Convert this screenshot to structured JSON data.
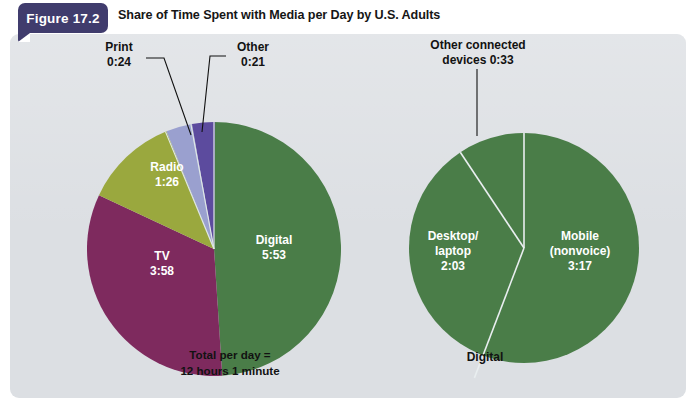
{
  "figure": {
    "badge_label": "Figure 17.2",
    "title": "Share of Time Spent with Media per Day by U.S. Adults"
  },
  "colors": {
    "badge_bg": "#403c6d",
    "panel_bg": "#dcdfe3",
    "digital_green": "#4a7d48",
    "tv_magenta": "#7e2a5e",
    "radio_olive": "#9aa83e",
    "print_periwinkle": "#9aa0cf",
    "other_purple": "#5c4b9e",
    "label_dark": "#121212",
    "label_light": "#ffffff"
  },
  "chart_data": [
    {
      "type": "pie",
      "name": "media-share-pie",
      "title": "Share of Time Spent with Media per Day by U.S. Adults",
      "total_label_line1": "Total per day =",
      "total_label_line2": "12 hours 1 minute",
      "total_minutes": 721,
      "legend": "inside-and-callout",
      "categories": [
        "Digital",
        "Other",
        "Print",
        "Radio",
        "TV"
      ],
      "values": [
        353,
        21,
        24,
        86,
        238
      ],
      "slices": [
        {
          "label": "Digital",
          "value_label": "5:53",
          "minutes": 353,
          "color": "#4a7d48",
          "label_position": "inside"
        },
        {
          "label": "Other",
          "value_label": "0:21",
          "minutes": 21,
          "color": "#5c4b9e",
          "label_position": "callout"
        },
        {
          "label": "Print",
          "value_label": "0:24",
          "minutes": 24,
          "color": "#9aa0cf",
          "label_position": "callout"
        },
        {
          "label": "Radio",
          "value_label": "1:26",
          "minutes": 86,
          "color": "#9aa83e",
          "label_position": "inside"
        },
        {
          "label": "TV",
          "value_label": "3:58",
          "minutes": 238,
          "color": "#7e2a5e",
          "label_position": "inside"
        }
      ]
    },
    {
      "type": "pie",
      "name": "digital-breakout-pie",
      "title": "Digital",
      "breakout_label": "Digital",
      "total_minutes": 353,
      "legend": "inside-and-callout",
      "categories": [
        "Mobile (nonvoice)",
        "Desktop/laptop",
        "Other connected devices"
      ],
      "values": [
        197,
        123,
        33
      ],
      "slices": [
        {
          "label": "Mobile",
          "label_line2": "(nonvoice)",
          "value_label": "3:17",
          "minutes": 197,
          "color": "#4a7d48",
          "label_position": "inside"
        },
        {
          "label": "Desktop/",
          "label_line2": "laptop",
          "value_label": "2:03",
          "minutes": 123,
          "color": "#4a7d48",
          "label_position": "inside"
        },
        {
          "label": "Other connected",
          "label_line2": "devices 0:33",
          "value_label": "0:33",
          "minutes": 33,
          "color": "#4a7d48",
          "label_position": "callout"
        }
      ]
    }
  ],
  "labels": {
    "left": {
      "print_line1": "Print",
      "print_line2": "0:24",
      "other_line1": "Other",
      "other_line2": "0:21",
      "radio_line1": "Radio",
      "radio_line2": "1:26",
      "tv_line1": "TV",
      "tv_line2": "3:58",
      "digital_line1": "Digital",
      "digital_line2": "5:53",
      "total_line1": "Total per day =",
      "total_line2": "12 hours 1 minute"
    },
    "right": {
      "ocd_line1": "Other connected",
      "ocd_line2": "devices 0:33",
      "desktop_line1": "Desktop/",
      "desktop_line2": "laptop",
      "desktop_line3": "2:03",
      "mobile_line1": "Mobile",
      "mobile_line2": "(nonvoice)",
      "mobile_line3": "3:17",
      "digital_caption": "Digital"
    }
  }
}
